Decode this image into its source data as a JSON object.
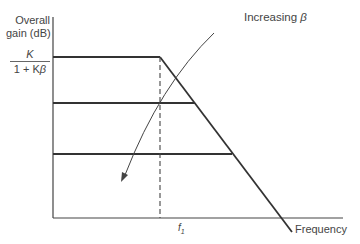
{
  "diagram": {
    "y_axis_label_line1": "Overall",
    "y_axis_label_line2": "gain (dB)",
    "gain_numerator": "K",
    "gain_denominator_prefix": "1 + K",
    "gain_denominator_symbol": "β",
    "annotation_text": "Increasing ",
    "annotation_symbol": "β",
    "cutoff_label": "f",
    "cutoff_subscript": "1",
    "x_axis_label": "Frequency",
    "colors": {
      "line": "#333333",
      "text": "#444444",
      "background": "#ffffff"
    }
  }
}
